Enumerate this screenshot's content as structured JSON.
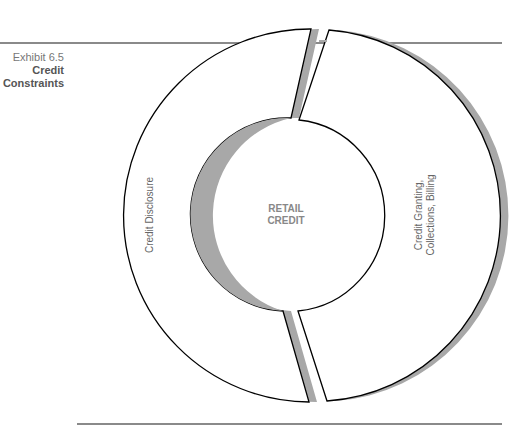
{
  "exhibit": {
    "number": "Exhibit 6.5",
    "title_line1": "Credit",
    "title_line2": "Constraints"
  },
  "diagram": {
    "center_label_line1": "RETAIL",
    "center_label_line2": "CREDIT",
    "segments": [
      {
        "label": "Credit Disclosure",
        "side": "left"
      },
      {
        "label_line1": "Credit Granting,",
        "label_line2": "Collections, Billing",
        "side": "right"
      }
    ],
    "colors": {
      "outline": "#000000",
      "shadow": "#a8a8a8",
      "fill": "#ffffff",
      "rule": "#8a8a8a"
    }
  }
}
